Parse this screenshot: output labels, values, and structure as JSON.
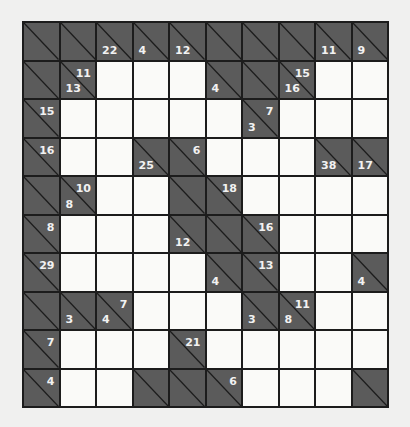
{
  "puzzle": {
    "type": "kakuro",
    "rows": 10,
    "cols": 10,
    "colors": {
      "page_background": "#f0f0ef",
      "clue_cell": "#5b5b5b",
      "white_cell": "#fafaf8",
      "grid_line": "#1c1c1c",
      "clue_text": "#f2f2f2"
    },
    "grid": [
      [
        {
          "t": "B"
        },
        {
          "t": "B"
        },
        {
          "t": "B",
          "down": "22"
        },
        {
          "t": "B",
          "down": "4"
        },
        {
          "t": "B",
          "down": "12"
        },
        {
          "t": "B"
        },
        {
          "t": "B"
        },
        {
          "t": "B"
        },
        {
          "t": "B",
          "down": "11"
        },
        {
          "t": "B",
          "down": "9"
        }
      ],
      [
        {
          "t": "B"
        },
        {
          "t": "B",
          "right": "11",
          "down": "13"
        },
        {
          "t": "W"
        },
        {
          "t": "W"
        },
        {
          "t": "W"
        },
        {
          "t": "B",
          "down": "4"
        },
        {
          "t": "B"
        },
        {
          "t": "B",
          "right": "15",
          "down": "16"
        },
        {
          "t": "W"
        },
        {
          "t": "W"
        }
      ],
      [
        {
          "t": "B",
          "right": "15"
        },
        {
          "t": "W"
        },
        {
          "t": "W"
        },
        {
          "t": "W"
        },
        {
          "t": "W"
        },
        {
          "t": "W"
        },
        {
          "t": "B",
          "right": "7",
          "down": "3"
        },
        {
          "t": "W"
        },
        {
          "t": "W"
        },
        {
          "t": "W"
        }
      ],
      [
        {
          "t": "B",
          "right": "16"
        },
        {
          "t": "W"
        },
        {
          "t": "W"
        },
        {
          "t": "B",
          "down": "25"
        },
        {
          "t": "B",
          "right": "6"
        },
        {
          "t": "W"
        },
        {
          "t": "W"
        },
        {
          "t": "W"
        },
        {
          "t": "B",
          "down": "38"
        },
        {
          "t": "B",
          "down": "17"
        }
      ],
      [
        {
          "t": "B"
        },
        {
          "t": "B",
          "right": "10",
          "down": "8"
        },
        {
          "t": "W"
        },
        {
          "t": "W"
        },
        {
          "t": "B"
        },
        {
          "t": "B",
          "right": "18"
        },
        {
          "t": "W"
        },
        {
          "t": "W"
        },
        {
          "t": "W"
        },
        {
          "t": "W"
        }
      ],
      [
        {
          "t": "B",
          "right": "8"
        },
        {
          "t": "W"
        },
        {
          "t": "W"
        },
        {
          "t": "W"
        },
        {
          "t": "B",
          "down": "12"
        },
        {
          "t": "B"
        },
        {
          "t": "B",
          "right": "16"
        },
        {
          "t": "W"
        },
        {
          "t": "W"
        },
        {
          "t": "W"
        }
      ],
      [
        {
          "t": "B",
          "right": "29"
        },
        {
          "t": "W"
        },
        {
          "t": "W"
        },
        {
          "t": "W"
        },
        {
          "t": "W"
        },
        {
          "t": "B",
          "down": "4"
        },
        {
          "t": "B",
          "right": "13"
        },
        {
          "t": "W"
        },
        {
          "t": "W"
        },
        {
          "t": "B",
          "down": "4"
        }
      ],
      [
        {
          "t": "B"
        },
        {
          "t": "B",
          "down": "3"
        },
        {
          "t": "B",
          "right": "7",
          "down": "4"
        },
        {
          "t": "W"
        },
        {
          "t": "W"
        },
        {
          "t": "W"
        },
        {
          "t": "B",
          "down": "3"
        },
        {
          "t": "B",
          "right": "11",
          "down": "8"
        },
        {
          "t": "W"
        },
        {
          "t": "W"
        }
      ],
      [
        {
          "t": "B",
          "right": "7"
        },
        {
          "t": "W"
        },
        {
          "t": "W"
        },
        {
          "t": "W"
        },
        {
          "t": "B",
          "right": "21"
        },
        {
          "t": "W"
        },
        {
          "t": "W"
        },
        {
          "t": "W"
        },
        {
          "t": "W"
        },
        {
          "t": "W"
        }
      ],
      [
        {
          "t": "B",
          "right": "4"
        },
        {
          "t": "W"
        },
        {
          "t": "W"
        },
        {
          "t": "B"
        },
        {
          "t": "B"
        },
        {
          "t": "B",
          "right": "6"
        },
        {
          "t": "W"
        },
        {
          "t": "W"
        },
        {
          "t": "W"
        },
        {
          "t": "B"
        }
      ]
    ]
  }
}
